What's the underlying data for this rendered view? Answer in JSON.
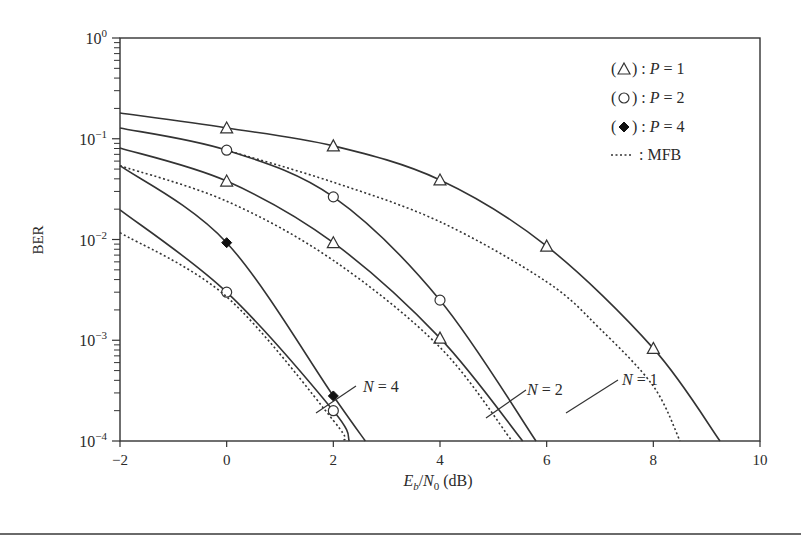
{
  "chart_data": {
    "type": "line",
    "title": "",
    "xlabel": "E_b/N_0 (dB)",
    "xlabel_parts": {
      "E": "E",
      "b": "b",
      "slash": "/",
      "N": "N",
      "zero": "0",
      "unit": "(dB)"
    },
    "ylabel": "BER",
    "xlim": [
      -2,
      10
    ],
    "ylim": [
      0.0001,
      1
    ],
    "yscale": "log",
    "grid": false,
    "x_ticks": [
      "−2",
      "0",
      "2",
      "4",
      "6",
      "8",
      "10"
    ],
    "x_tick_values": [
      -2,
      0,
      2,
      4,
      6,
      8,
      10
    ],
    "y_ticks": [
      {
        "base": "10",
        "exp": "0",
        "value": 1
      },
      {
        "base": "10",
        "exp": "−1",
        "value": 0.1
      },
      {
        "base": "10",
        "exp": "−2",
        "value": 0.01
      },
      {
        "base": "10",
        "exp": "−3",
        "value": 0.001
      },
      {
        "base": "10",
        "exp": "−4",
        "value": 0.0001
      }
    ],
    "legend": {
      "position": "upper right",
      "entries": [
        {
          "symbol": "triangle",
          "label_prefix": "(",
          "label_suffix": ") :",
          "text": "P = 1"
        },
        {
          "symbol": "circle",
          "label_prefix": "(",
          "label_suffix": ") :",
          "text": "P = 2"
        },
        {
          "symbol": "diamond",
          "label_prefix": "(",
          "label_suffix": ") :",
          "text": "P = 4"
        },
        {
          "symbol": "dotted",
          "label_prefix": "",
          "label_suffix": ":",
          "text": "MFB"
        }
      ]
    },
    "annotations": [
      {
        "text": "N = 1",
        "x": 7.1,
        "y": 0.0012
      },
      {
        "text": "N = 2",
        "x": 5.2,
        "y": 0.00022
      },
      {
        "text": "N = 4",
        "x": 1.9,
        "y": 0.00024
      }
    ],
    "series": [
      {
        "name": "N=1, P=1",
        "group": "N=1",
        "marker": "triangle",
        "style": "solid",
        "x": [
          -2,
          0,
          2,
          4,
          6,
          8,
          9.25
        ],
        "y": [
          0.18,
          0.128,
          0.085,
          0.039,
          0.0086,
          0.00083,
          0.0001
        ],
        "markers_at": [
          0,
          2,
          4,
          6,
          8
        ]
      },
      {
        "name": "N=1, MFB",
        "group": "N=1",
        "marker": "none",
        "style": "dotted",
        "x": [
          0,
          2,
          4,
          6,
          7,
          8,
          8.5
        ],
        "y": [
          0.077,
          0.037,
          0.015,
          0.0038,
          0.0013,
          0.00035,
          0.0001
        ]
      },
      {
        "name": "N=2, P=2",
        "group": "N=2",
        "marker": "circle",
        "style": "solid",
        "x": [
          -2,
          0,
          2,
          4,
          5.8
        ],
        "y": [
          0.128,
          0.077,
          0.0265,
          0.0025,
          0.0001
        ],
        "markers_at": [
          0,
          2,
          4
        ]
      },
      {
        "name": "N=2, P=1",
        "group": "N=2",
        "marker": "triangle",
        "style": "solid",
        "x": [
          -2,
          0,
          2,
          4,
          5.55
        ],
        "y": [
          0.081,
          0.038,
          0.0093,
          0.00105,
          0.0001
        ],
        "markers_at": [
          0,
          2,
          4
        ]
      },
      {
        "name": "N=2, MFB",
        "group": "N=2",
        "marker": "none",
        "style": "dotted",
        "x": [
          -2,
          0,
          2,
          4,
          5.35
        ],
        "y": [
          0.054,
          0.024,
          0.0062,
          0.00085,
          0.0001
        ]
      },
      {
        "name": "N=4, P=4",
        "group": "N=4",
        "marker": "diamond",
        "style": "solid",
        "x": [
          -2,
          0,
          2,
          2.6
        ],
        "y": [
          0.054,
          0.0093,
          0.00028,
          0.0001
        ],
        "markers_at": [
          0,
          2
        ]
      },
      {
        "name": "N=4, P=2",
        "group": "N=4",
        "marker": "circle",
        "style": "solid",
        "x": [
          -2,
          0,
          2,
          2.3
        ],
        "y": [
          0.0197,
          0.003,
          0.0002,
          0.0001
        ],
        "markers_at": [
          0,
          2
        ]
      },
      {
        "name": "N=4, MFB",
        "group": "N=4",
        "marker": "none",
        "style": "dotted",
        "x": [
          -2,
          0,
          2,
          2.2
        ],
        "y": [
          0.0117,
          0.0027,
          0.00016,
          0.0001
        ]
      }
    ]
  },
  "colors": {
    "line": "#333333",
    "axis": "#333333",
    "background": "#ffffff"
  }
}
